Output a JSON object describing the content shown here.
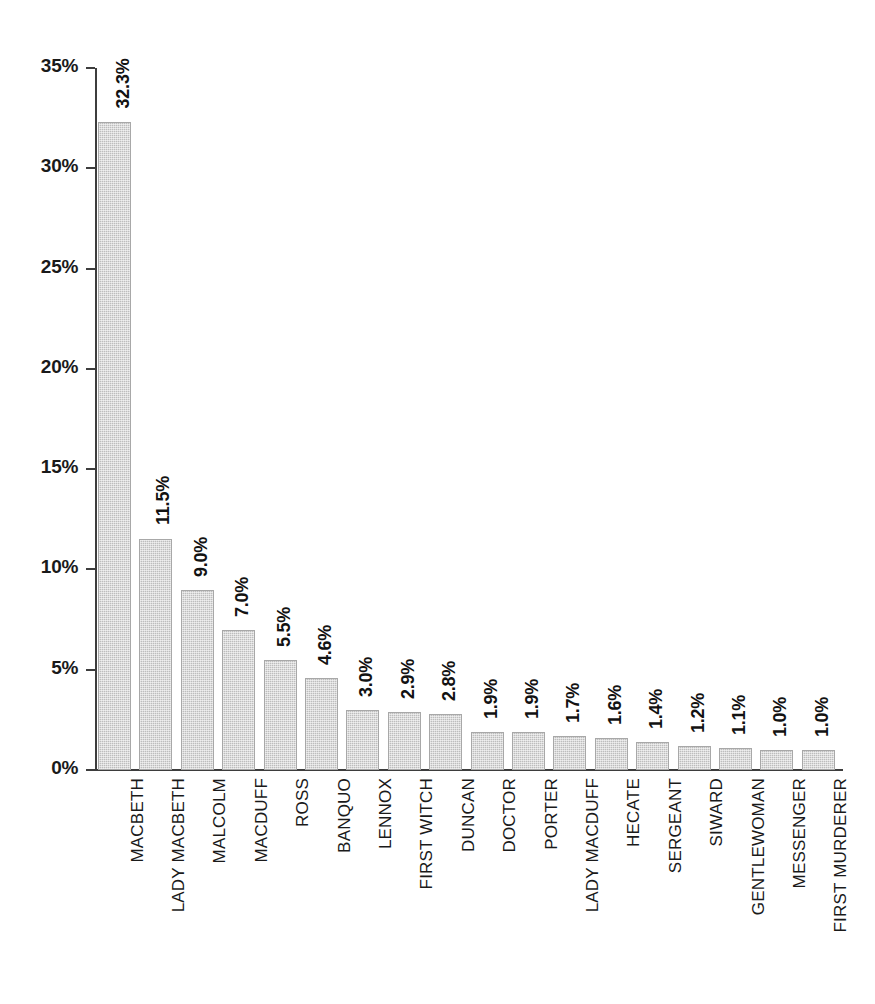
{
  "chart_data": {
    "type": "bar",
    "title": "",
    "subtitle": "",
    "xlabel": "",
    "ylabel": "",
    "ylim": [
      0,
      35
    ],
    "y_unit": "%",
    "grid": false,
    "legend": "none",
    "orientation": "vertical",
    "bar_color": "#bdbdbd",
    "bar_edge_color": "#a8a8a8",
    "axis_color": "#3d3d3d",
    "y_ticks": [
      "0%",
      "5%",
      "10%",
      "15%",
      "20%",
      "25%",
      "30%",
      "35%"
    ],
    "y_tick_values": [
      0,
      5,
      10,
      15,
      20,
      25,
      30,
      35
    ],
    "categories": [
      "MACBETH",
      "LADY MACBETH",
      "MALCOLM",
      "MACDUFF",
      "ROSS",
      "BANQUO",
      "LENNOX",
      "FIRST WITCH",
      "DUNCAN",
      "DOCTOR",
      "PORTER",
      "LADY MACDUFF",
      "HECATE",
      "SERGEANT",
      "SIWARD",
      "GENTLEWOMAN",
      "MESSENGER",
      "FIRST MURDERER"
    ],
    "values": [
      32.3,
      11.5,
      9.0,
      7.0,
      5.5,
      4.6,
      3.0,
      2.9,
      2.8,
      1.9,
      1.9,
      1.7,
      1.6,
      1.4,
      1.2,
      1.1,
      1.0,
      1.0
    ],
    "data_labels": [
      "32.3%",
      "11.5%",
      "9.0%",
      "7.0%",
      "5.5%",
      "4.6%",
      "3.0%",
      "2.9%",
      "2.8%",
      "1.9%",
      "1.9%",
      "1.7%",
      "1.6%",
      "1.4%",
      "1.2%",
      "1.1%",
      "1.0%",
      "1.0%"
    ]
  }
}
